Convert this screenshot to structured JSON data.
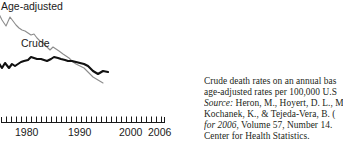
{
  "figure": {
    "type": "line-chart-with-caption"
  },
  "chart_data": {
    "type": "line",
    "title": "",
    "xlabel": "",
    "ylabel": "",
    "xlim": [
      1976,
      2006
    ],
    "ylim": [
      0,
      100
    ],
    "grid": false,
    "legend_position": "inline-labels",
    "x_ticks_labeled": [
      "1980",
      "1990",
      "2000",
      "2006"
    ],
    "x_minor_tick_count": 29,
    "series": [
      {
        "name": "Age-adjusted",
        "color": "#8c8c8c",
        "line_width": 1.1,
        "x": [
          1976,
          1977,
          1978,
          1979,
          1980,
          1981,
          1982,
          1983,
          1984,
          1985,
          1986,
          1987,
          1988,
          1989,
          1990,
          1991,
          1992,
          1993,
          1994,
          1995,
          1996,
          1997,
          1998,
          1999,
          2000,
          2001,
          2002,
          2003,
          2004,
          2005,
          2006
        ],
        "values": [
          91,
          85,
          90,
          80,
          78,
          76,
          75,
          74,
          73,
          72,
          70,
          71,
          68,
          66,
          65,
          63,
          61,
          63,
          61,
          60,
          58,
          57,
          56,
          53,
          52,
          51,
          50,
          47,
          44,
          42,
          41
        ]
      },
      {
        "name": "Crude",
        "color": "#111111",
        "line_width": 2.1,
        "x": [
          1976,
          1977,
          1978,
          1979,
          1980,
          1981,
          1982,
          1983,
          1984,
          1985,
          1986,
          1987,
          1988,
          1989,
          1990,
          1991,
          1992,
          1993,
          1994,
          1995,
          1996,
          1997,
          1998,
          1999,
          2000,
          2001,
          2002,
          2003,
          2004,
          2005,
          2006
        ],
        "values": [
          55,
          50,
          54,
          50,
          53,
          51,
          53,
          54,
          55,
          56,
          58,
          57,
          56,
          56,
          55,
          54,
          56,
          58,
          57,
          56,
          55,
          54,
          54,
          53,
          52,
          51,
          50,
          46,
          44,
          46,
          45
        ]
      }
    ]
  },
  "chart": {
    "labels": {
      "age_adjusted": "Age-adjusted",
      "crude": "Crude"
    },
    "axis": {
      "ticks": [
        {
          "label": "1980",
          "x": 15
        },
        {
          "label": "1990",
          "x": 68
        },
        {
          "label": "2000",
          "x": 119
        },
        {
          "label": "2006",
          "x": 148
        }
      ]
    }
  },
  "caption": {
    "lines": [
      {
        "segments": [
          {
            "text": "Crude death rates on an annual bas",
            "italic": false
          }
        ]
      },
      {
        "segments": [
          {
            "text": "age-adjusted rates per 100,000 U.S",
            "italic": false
          }
        ]
      },
      {
        "segments": [
          {
            "text": "Source:",
            "italic": true
          },
          {
            "text": " Heron, M., Hoyert, D. L., M",
            "italic": false
          }
        ]
      },
      {
        "segments": [
          {
            "text": "Kochanek, K., & Tejeda-Vera, B. (",
            "italic": false
          }
        ]
      },
      {
        "segments": [
          {
            "text": "for 2006",
            "italic": true
          },
          {
            "text": ", Volume 57, Number 14.",
            "italic": false
          }
        ]
      },
      {
        "segments": [
          {
            "text": "Center for Health Statistics.",
            "italic": false
          }
        ]
      }
    ]
  }
}
